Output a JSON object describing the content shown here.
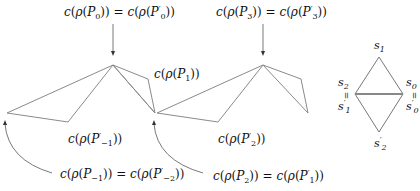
{
  "labels": {
    "top_left": {
      "c": "c",
      "rho": "ρ",
      "lhs_sub": "0",
      "rhs_sub": "0",
      "text": "c(ρ(P0)) = c(ρ(P'0))"
    },
    "top_middle": {
      "text": "c(ρ(P3)) = c(ρ(P'3))",
      "lhs_sub": "3",
      "rhs_sub": "3"
    },
    "p1": {
      "text": "c(ρ(P1))",
      "sub": "1"
    },
    "p_minus1_prime": {
      "text": "c(ρ(P'-1))",
      "sub": "−1"
    },
    "p2_prime": {
      "text": "c(ρ(P'2))",
      "sub": "2"
    },
    "bottom_left": {
      "text": "c(ρ(P-1)) = c(ρ(P'-2))",
      "lhs_sub": "−1",
      "rhs_sub": "−2"
    },
    "bottom_middle": {
      "text": "c(ρ(P2)) = c(ρ(P'1))",
      "lhs_sub": "2",
      "rhs_sub": "1"
    }
  },
  "diamond": {
    "top": {
      "name": "s",
      "sub": "1"
    },
    "left_top": {
      "name": "s",
      "sub": "2"
    },
    "left_bottom": {
      "name": "s",
      "sub": "1",
      "prime": "′"
    },
    "right_top": {
      "name": "s",
      "sub": "0"
    },
    "right_bottom": {
      "name": "s",
      "sub": "0",
      "prime": "′"
    },
    "bottom": {
      "name": "s",
      "sub": "2",
      "prime": "′"
    },
    "equals": "="
  },
  "common": {
    "c": "c",
    "rho": "ρ",
    "P": "P",
    "prime": "′",
    "open": "(",
    "close": ")",
    "eq": " = "
  },
  "colors": {
    "polygon_stroke": "#8a8a8a",
    "arrow": "#555555",
    "text": "#111111"
  }
}
